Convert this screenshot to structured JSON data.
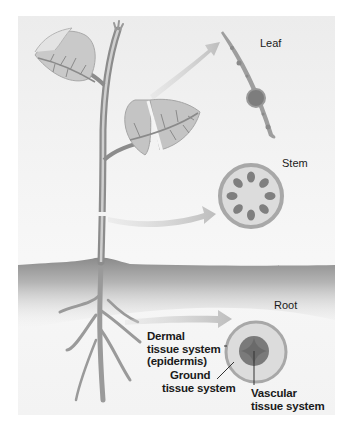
{
  "figure": {
    "colors": {
      "background": "#f2f2f2",
      "leaf_fill": "#c4c4c4",
      "vein": "#8a8a8a",
      "arrow": "#c9c9c9",
      "soil_dark": "#8e8e8e",
      "tissue_outer": "#a8a8a8",
      "tissue_inner": "#dcdcdc",
      "vascular": "#7a7a7a"
    }
  },
  "labels": {
    "leaf": "Leaf",
    "stem": "Stem",
    "root": "Root",
    "dermal": [
      "Dermal",
      "tissue system",
      "(epidermis)"
    ],
    "ground": [
      "Ground",
      "tissue system"
    ],
    "vascular": [
      "Vascular",
      "tissue system"
    ]
  },
  "cross_sections": [
    {
      "name": "leaf",
      "label": "Leaf"
    },
    {
      "name": "stem",
      "label": "Stem",
      "vascular_bundles": 8
    },
    {
      "name": "root",
      "label": "Root"
    }
  ]
}
